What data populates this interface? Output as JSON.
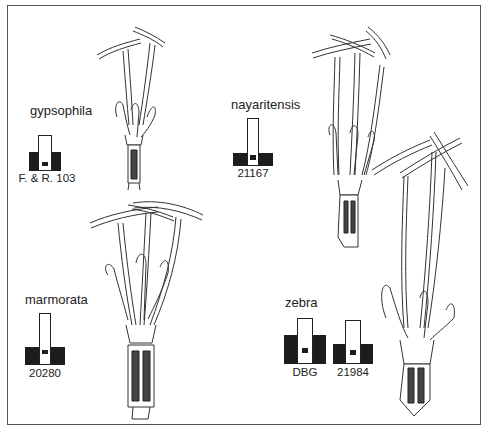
{
  "figure": {
    "species": [
      {
        "name": "gypsophila",
        "specimens": [
          {
            "code": "F. & R. 103"
          }
        ]
      },
      {
        "name": "nayaritensis",
        "specimens": [
          {
            "code": "21167"
          }
        ]
      },
      {
        "name": "marmorata",
        "specimens": [
          {
            "code": "20280"
          }
        ]
      },
      {
        "name": "zebra",
        "specimens": [
          {
            "code": "DBG"
          },
          {
            "code": "21984"
          }
        ]
      }
    ],
    "colors": {
      "ink": "#1d1d1d",
      "frame": "#555555",
      "background": "#ffffff"
    }
  }
}
